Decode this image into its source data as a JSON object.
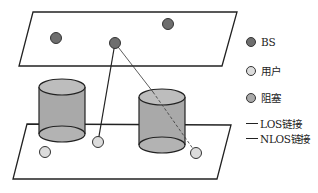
{
  "diagram": {
    "type": "network-scenario",
    "top_plane": {
      "label": "base-station-layer",
      "points": [
        [
          33,
          12
        ],
        [
          237,
          12
        ],
        [
          222,
          66
        ],
        [
          19,
          66
        ]
      ]
    },
    "bottom_plane": {
      "label": "user-layer",
      "points": [
        [
          27,
          124
        ],
        [
          231,
          125
        ],
        [
          217,
          179
        ],
        [
          13,
          179
        ]
      ]
    },
    "base_stations": [
      {
        "x": 56,
        "y": 38
      },
      {
        "x": 168,
        "y": 24
      },
      {
        "x": 115,
        "y": 43
      }
    ],
    "users": [
      {
        "x": 45,
        "y": 152
      },
      {
        "x": 98,
        "y": 142
      },
      {
        "x": 196,
        "y": 153
      }
    ],
    "obstacles": [
      {
        "cx": 62,
        "top_y": 87,
        "bottom_y": 134,
        "rx": 23,
        "ry": 8
      },
      {
        "cx": 162,
        "top_y": 97,
        "bottom_y": 145,
        "rx": 23,
        "ry": 8
      }
    ],
    "links": [
      {
        "type": "LOS",
        "from": [
          115,
          43
        ],
        "to": [
          98,
          142
        ],
        "style": "solid"
      },
      {
        "type": "NLOS",
        "from": [
          115,
          43
        ],
        "to": [
          196,
          153
        ],
        "style": "thin-dashed-through-obstacle"
      }
    ],
    "colors": {
      "bs": "#6e6e6e",
      "user": "#dcdcdc",
      "obstacle": "#a9a9a9",
      "obstacle_top": "#bdbdbd",
      "stroke": "#222222"
    }
  },
  "legend": {
    "items": [
      {
        "symbol": "dot",
        "color": "#6e6e6e",
        "label": "BS"
      },
      {
        "symbol": "dot",
        "color": "#dcdcdc",
        "label": "用户"
      },
      {
        "symbol": "dot",
        "color": "#a9a9a9",
        "label": "阻塞"
      },
      {
        "symbol": "line",
        "label": "LOS链接"
      },
      {
        "symbol": "line",
        "label": "NLOS链接"
      }
    ]
  }
}
